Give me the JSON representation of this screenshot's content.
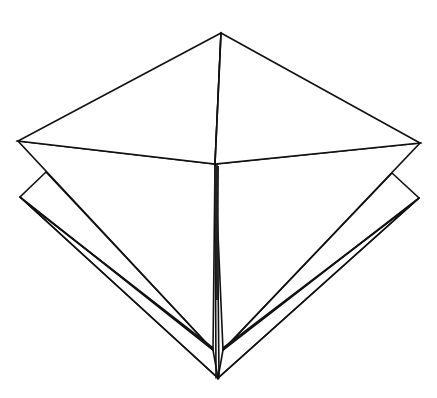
{
  "diagram": {
    "colors": {
      "line": "#111111",
      "paper": "#ffffff",
      "shade_top": "#a6a6a6",
      "shade_bottom": "#ffffff",
      "flap_fill": "#f7f7f7"
    },
    "vertices": {
      "top": [
        221,
        33
      ],
      "center": [
        215,
        164
      ],
      "left": [
        18,
        141
      ],
      "right": [
        420,
        143
      ],
      "left_flap": [
        20,
        197
      ],
      "right_flap": [
        419,
        198
      ],
      "left_cross": [
        46,
        172
      ],
      "right_cross": [
        392,
        173
      ],
      "inner_left_bottom": [
        213,
        350
      ],
      "inner_right_bottom": [
        223,
        350
      ],
      "bottom": [
        218,
        378
      ]
    },
    "parts": [
      {
        "name": "top-left-face",
        "shade": "white"
      },
      {
        "name": "top-right-face",
        "shade": "white"
      },
      {
        "name": "left-kite-face",
        "shade": "gradient"
      },
      {
        "name": "right-kite-face",
        "shade": "gradient"
      },
      {
        "name": "left-lower-flap",
        "shade": "white"
      },
      {
        "name": "right-lower-flap",
        "shade": "white"
      }
    ],
    "caption": ""
  }
}
